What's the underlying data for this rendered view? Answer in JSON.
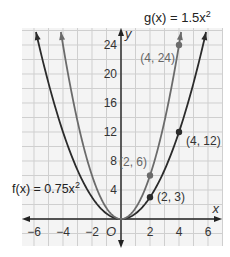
{
  "chart_data": {
    "type": "line",
    "title": "",
    "xlabel": "x",
    "ylabel": "y",
    "origin_label": "O",
    "xlim": [
      -7,
      7
    ],
    "ylim": [
      -2,
      26
    ],
    "grid": true,
    "x_ticks": [
      "−6",
      "−4",
      "−2",
      "2",
      "4",
      "6"
    ],
    "x_tick_values": [
      -6,
      -4,
      -2,
      2,
      4,
      6
    ],
    "y_ticks": [
      "4",
      "8",
      "12",
      "16",
      "20",
      "24"
    ],
    "y_tick_values": [
      4,
      8,
      12,
      16,
      20,
      24
    ],
    "series": [
      {
        "name": "f(x) = 0.75x²",
        "label_text": "f(x) = 0.75x",
        "label_sup": "2",
        "coef": 0.75,
        "color": "#2b2b2b",
        "points": [
          {
            "x": 2,
            "y": 3,
            "label": "(2, 3)"
          },
          {
            "x": 4,
            "y": 12,
            "label": "(4, 12)"
          }
        ]
      },
      {
        "name": "g(x) = 1.5x²",
        "label_text": "g(x) = 1.5x",
        "label_sup": "2",
        "coef": 1.5,
        "color": "#6b6b6b",
        "points": [
          {
            "x": 2,
            "y": 6,
            "label": "(2, 6)"
          },
          {
            "x": 4,
            "y": 24,
            "label": "(4, 24)"
          }
        ]
      }
    ]
  }
}
